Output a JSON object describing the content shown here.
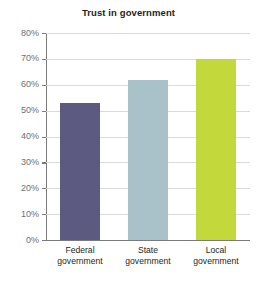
{
  "chart_data": {
    "type": "bar",
    "title": "Trust in government",
    "xlabel": "",
    "ylabel": "",
    "categories": [
      "Federal government",
      "State government",
      "Local government"
    ],
    "category_lines": [
      [
        "Federal",
        "government"
      ],
      [
        "State",
        "government"
      ],
      [
        "Local",
        "government"
      ]
    ],
    "values": [
      53,
      62,
      70
    ],
    "value_labels": [
      "53%",
      "62%",
      "70%"
    ],
    "ylim": [
      0,
      80
    ],
    "ytick_values": [
      80,
      70,
      60,
      50,
      40,
      30,
      20,
      10,
      0
    ],
    "ytick_labels": [
      "80%",
      "70%",
      "60%",
      "50%",
      "40%",
      "30%",
      "20%",
      "10%",
      "0%"
    ],
    "grid": true,
    "legend": "none",
    "bar_colors": [
      "#5c5a80",
      "#a9c2ca",
      "#c2d83b"
    ],
    "colors": {
      "grid": "#d9d9d9",
      "axis": "#7a7a78",
      "tick_label": "#6d6e71",
      "title": "#231f20",
      "category_label": "#231f20",
      "background": "#ffffff"
    }
  }
}
